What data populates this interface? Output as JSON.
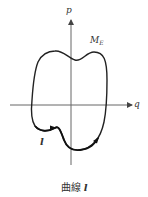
{
  "figure": {
    "axes": {
      "vertical_label": "p",
      "horizontal_label": "q"
    },
    "curve_label": {
      "base": "M",
      "subscript": "E"
    },
    "path_label": "l",
    "caption": {
      "text": "曲線",
      "variable": "l"
    },
    "colors": {
      "line": "#222222",
      "axis": "#555555",
      "text": "#333333"
    }
  }
}
